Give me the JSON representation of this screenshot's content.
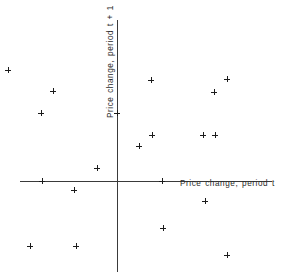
{
  "chart_data": {
    "type": "scatter",
    "title": "",
    "xlabel": "Price change, period t",
    "ylabel": "Price change, period t + 1",
    "xlim": [
      -117,
      169
    ],
    "ylim": [
      -98,
      161
    ],
    "grid": false,
    "legend": null,
    "marker": "plus",
    "marker_color": "#1b1b1b",
    "axis_color": "#3a3a3a",
    "origin_px": {
      "x": 117,
      "y": 181
    },
    "axis_extent_px": {
      "x_axis_start": 20,
      "x_axis_end": 272,
      "y_axis_start": 20,
      "y_axis_end": 272
    },
    "n_points": 18,
    "points_px": [
      {
        "x": 8,
        "y": 70
      },
      {
        "x": 53,
        "y": 91
      },
      {
        "x": 41,
        "y": 113
      },
      {
        "x": 151,
        "y": 80
      },
      {
        "x": 227,
        "y": 79
      },
      {
        "x": 214,
        "y": 92
      },
      {
        "x": 117,
        "y": 113
      },
      {
        "x": 152,
        "y": 135
      },
      {
        "x": 139,
        "y": 146
      },
      {
        "x": 203,
        "y": 135
      },
      {
        "x": 215,
        "y": 135
      },
      {
        "x": 97,
        "y": 168
      },
      {
        "x": 42,
        "y": 181
      },
      {
        "x": 162,
        "y": 181
      },
      {
        "x": 74,
        "y": 190
      },
      {
        "x": 205,
        "y": 201
      },
      {
        "x": 163,
        "y": 228
      },
      {
        "x": 30,
        "y": 246
      },
      {
        "x": 76,
        "y": 246
      },
      {
        "x": 227,
        "y": 255
      }
    ],
    "x": [
      -109,
      -64,
      -76,
      34,
      110,
      97,
      0,
      35,
      22,
      86,
      98,
      -20,
      -75,
      45,
      -43,
      88,
      46,
      -87,
      -41,
      110
    ],
    "y": [
      111,
      90,
      68,
      101,
      102,
      89,
      68,
      46,
      35,
      46,
      46,
      13,
      0,
      0,
      -9,
      -20,
      -47,
      -65,
      -65,
      -74
    ]
  },
  "labels": {
    "x_axis": "Price change, period t",
    "y_axis": "Price change, period t + 1"
  }
}
